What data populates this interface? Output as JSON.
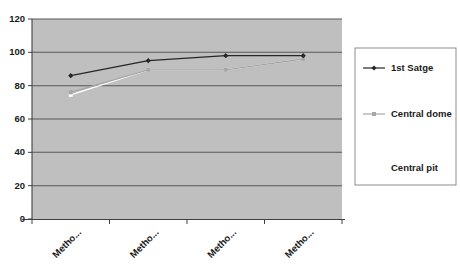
{
  "chart_data": {
    "type": "line",
    "title": "",
    "subtitle": "",
    "xlabel": "",
    "ylabel": "",
    "ylim": [
      0,
      120
    ],
    "ytick_values": [
      0,
      20,
      40,
      60,
      80,
      100,
      120
    ],
    "ytick_labels": [
      "0",
      "20",
      "40",
      "60",
      "80",
      "100",
      "120"
    ],
    "categories": [
      "Metho...",
      "Metho...",
      "Metho...",
      "Metho..."
    ],
    "grid": "horizontal",
    "plot_background": "#bfbfbf",
    "legend_position": "right",
    "series": [
      {
        "name": "1st Satge",
        "color": "#262626",
        "marker": "diamond",
        "values": [
          86,
          95,
          98,
          98
        ]
      },
      {
        "name": "Central dome",
        "color": "#a6a6a6",
        "marker": "square",
        "values": [
          76,
          89.5,
          89.5,
          96
        ]
      },
      {
        "name": "Central pit",
        "color": "#ffffff",
        "marker": "square",
        "values": [
          74.5,
          89.5,
          89.5,
          96
        ]
      }
    ]
  },
  "legend": {
    "entries": [
      {
        "label": "1st Satge"
      },
      {
        "label": "Central dome"
      },
      {
        "label": "Central pit"
      }
    ]
  },
  "colors": {
    "plot_fill": "#bfbfbf",
    "gridline": "#595959",
    "axis": "#404040",
    "series_dark": "#262626",
    "series_gray": "#a6a6a6",
    "series_white": "#ffffff",
    "legend_border": "#808080",
    "text": "#1a1a1a"
  }
}
